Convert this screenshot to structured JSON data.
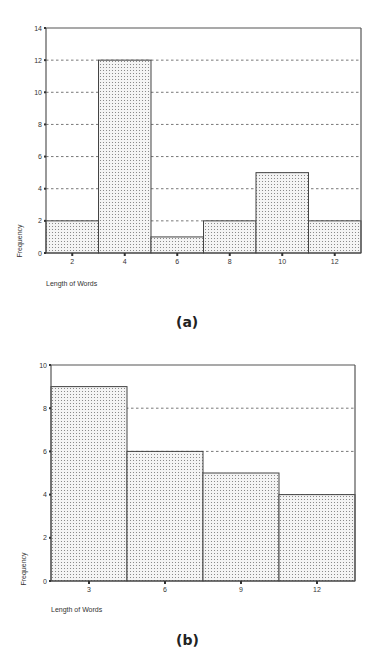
{
  "chart_data": [
    {
      "type": "bar",
      "title": "",
      "caption": "(a)",
      "xlabel": "Length of Words",
      "ylabel": "Frequency",
      "categories": [
        "2",
        "4",
        "6",
        "8",
        "10",
        "12"
      ],
      "values": [
        2,
        12,
        1,
        2,
        5,
        2
      ],
      "ylim": [
        0,
        14
      ],
      "yticks": [
        0,
        2,
        4,
        6,
        8,
        10,
        12,
        14
      ],
      "grid": "dashed horizontal",
      "fill": "dotted",
      "legend": "none"
    },
    {
      "type": "bar",
      "title": "",
      "caption": "(b)",
      "xlabel": "Length of Words",
      "ylabel": "Frequency",
      "categories": [
        "3",
        "6",
        "9",
        "12"
      ],
      "values": [
        9,
        6,
        5,
        4
      ],
      "ylim": [
        0,
        10
      ],
      "yticks": [
        0,
        2,
        4,
        6,
        8,
        10
      ],
      "grid": "dashed horizontal",
      "fill": "dotted",
      "legend": "none"
    }
  ],
  "captions": {
    "a": "(a)",
    "b": "(b)"
  },
  "colors": {
    "axis": "#555555",
    "bar_edge": "#444444",
    "dot": "#777777",
    "grid": "#555555"
  }
}
